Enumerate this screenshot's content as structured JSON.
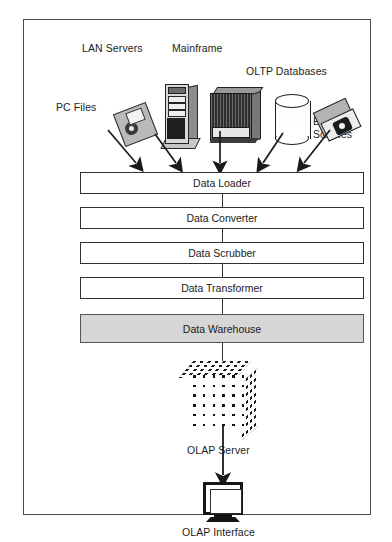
{
  "diagram": {
    "sources": [
      {
        "id": "pc-files",
        "label": "PC Files",
        "icon": "floppy-disk-icon"
      },
      {
        "id": "lan-servers",
        "label": "LAN Servers",
        "icon": "tower-server-icon"
      },
      {
        "id": "mainframe",
        "label": "Mainframe",
        "icon": "mainframe-cabinet-icon"
      },
      {
        "id": "oltp",
        "label": "OLTP Databases",
        "icon": "database-cylinder-icon"
      },
      {
        "id": "external",
        "label": "External Sources",
        "icon": "disk-drive-icon",
        "label_line1": "External",
        "label_line2": "Sources"
      }
    ],
    "pipeline": [
      {
        "id": "data-loader",
        "label": "Data Loader",
        "fill": "#ffffff"
      },
      {
        "id": "data-converter",
        "label": "Data Converter",
        "fill": "#ffffff"
      },
      {
        "id": "data-scrubber",
        "label": "Data Scrubber",
        "fill": "#ffffff"
      },
      {
        "id": "data-transformer",
        "label": "Data Transformer",
        "fill": "#ffffff"
      },
      {
        "id": "data-warehouse",
        "label": "Data Warehouse",
        "fill": "#d6d6d6"
      }
    ],
    "outputs": [
      {
        "id": "olap-server",
        "label": "OLAP Server",
        "icon": "olap-cube-icon"
      },
      {
        "id": "olap-interface",
        "label": "OLAP Interface",
        "icon": "crt-monitor-icon"
      }
    ],
    "colors": {
      "frame_border": "#4a4a4a",
      "box_border": "#2f2f2f",
      "warehouse_fill": "#d6d6d6",
      "arrow": "#1a1a1a",
      "background": "#ffffff",
      "text": "#1b1b1b"
    },
    "arrow_count_into_loader": 5
  }
}
